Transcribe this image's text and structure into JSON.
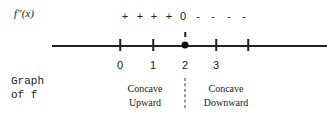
{
  "labels": {
    "second_derivative": "f\"(x)",
    "graph_of_f_line1": "Graph",
    "graph_of_f_line2": "of f"
  },
  "sign_chart": {
    "signs": [
      {
        "symbol": "+",
        "x": 125
      },
      {
        "symbol": "+",
        "x": 140
      },
      {
        "symbol": "+",
        "x": 154
      },
      {
        "symbol": "+",
        "x": 169
      },
      {
        "symbol": "0",
        "x": 183
      },
      {
        "symbol": "-",
        "x": 198
      },
      {
        "symbol": "-",
        "x": 213
      },
      {
        "symbol": "-",
        "x": 229
      },
      {
        "symbol": "-",
        "x": 244
      }
    ]
  },
  "number_line": {
    "ticks": [
      {
        "label": "0",
        "x": 120
      },
      {
        "label": "1",
        "x": 153
      },
      {
        "label": "2",
        "x": 185
      },
      {
        "label": "3",
        "x": 216
      },
      {
        "label": "",
        "x": 248
      }
    ],
    "marked_point": "2"
  },
  "regions": [
    {
      "line1": "Concave",
      "line2": "Upward",
      "x": 145
    },
    {
      "line1": "Concave",
      "line2": "Downward",
      "x": 226
    }
  ]
}
